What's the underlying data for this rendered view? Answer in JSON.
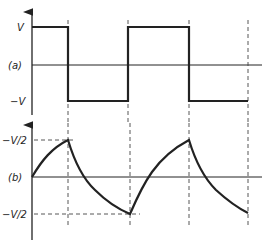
{
  "figure": {
    "panel_a": {
      "label": "(a)",
      "y_labels": {
        "high": "V",
        "low": "−V"
      },
      "waveform": "square",
      "description": "Square wave alternating between +V and −V"
    },
    "panel_b": {
      "label": "(b)",
      "y_labels": {
        "high": "−V/2",
        "low": "−V/2"
      },
      "waveform": "exponential charge/discharge",
      "description": "Capacitor voltage rising and falling exponentially between +V/2 and −V/2"
    },
    "colors": {
      "line": "#222222",
      "dash": "#444444",
      "background": "#ffffff"
    }
  }
}
